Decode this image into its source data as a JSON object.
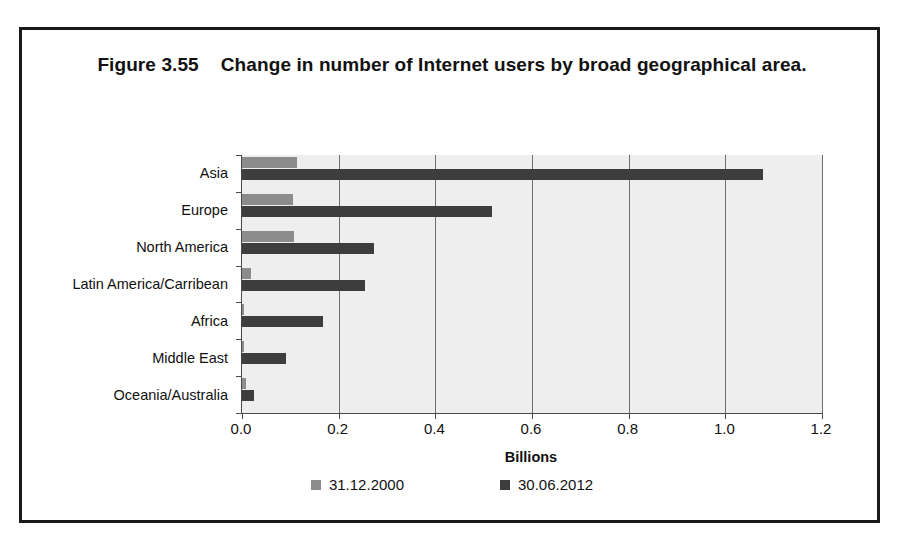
{
  "figure": {
    "number": "Figure 3.55",
    "title": "Change in number of Internet users by broad geographical area."
  },
  "chart_data": {
    "type": "bar",
    "orientation": "horizontal",
    "xlabel": "Billions",
    "ylabel": "",
    "xlim": [
      0.0,
      1.2
    ],
    "xticks": [
      "0.0",
      "0.2",
      "0.4",
      "0.6",
      "0.8",
      "1.0",
      "1.2"
    ],
    "xtick_values": [
      0.0,
      0.2,
      0.4,
      0.6,
      0.8,
      1.0,
      1.2
    ],
    "grid": true,
    "grid_axis": "x",
    "legend_position": "bottom",
    "categories": [
      "Asia",
      "Europe",
      "North America",
      "Latin America/Carribean",
      "Africa",
      "Middle East",
      "Oceania/Australia"
    ],
    "series": [
      {
        "name": "31.12.2000",
        "color": "#8c8c8c",
        "values": [
          0.114,
          0.105,
          0.108,
          0.018,
          0.0045,
          0.0033,
          0.0078
        ]
      },
      {
        "name": "30.06.2012",
        "color": "#3d3d3d",
        "values": [
          1.077,
          0.518,
          0.274,
          0.255,
          0.167,
          0.09,
          0.024
        ]
      }
    ]
  },
  "legend": {
    "items": [
      {
        "label": "31.12.2000",
        "color": "#8c8c8c"
      },
      {
        "label": "30.06.2012",
        "color": "#3d3d3d"
      }
    ]
  },
  "colors": {
    "series_2000": "#8c8c8c",
    "series_2012": "#3d3d3d",
    "plot_background": "#eeeeee",
    "gridline": "#6e6e6e",
    "frame": "#1a1a1a"
  }
}
